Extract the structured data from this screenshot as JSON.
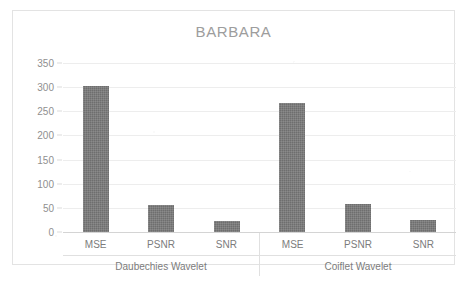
{
  "chart_data": {
    "type": "bar",
    "title": "BARBARA",
    "xlabel": "",
    "ylabel": "",
    "ylim": [
      0,
      350
    ],
    "ytick_labels": [
      "0",
      "50",
      "100",
      "150",
      "200",
      "250",
      "300",
      "350"
    ],
    "ytick_values": [
      0,
      50,
      100,
      150,
      200,
      250,
      300,
      350
    ],
    "grid": true,
    "legend": "none",
    "bar_color": "#6e6e6e",
    "groups": [
      {
        "name": "Daubechies Wavelet",
        "categories": [
          "MSE",
          "PSNR",
          "SNR"
        ],
        "values": [
          302,
          56,
          23
        ]
      },
      {
        "name": "Coiflet Wavelet",
        "categories": [
          "MSE",
          "PSNR",
          "SNR"
        ],
        "values": [
          268,
          59,
          25
        ]
      }
    ],
    "categories": [
      "MSE",
      "PSNR",
      "SNR",
      "MSE",
      "PSNR",
      "SNR"
    ],
    "values": [
      302,
      56,
      23,
      268,
      59,
      25
    ]
  },
  "title_color": "#9d9d9d",
  "axis_text_color": "#8f8f8f"
}
